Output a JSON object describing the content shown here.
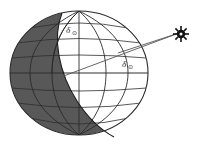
{
  "figure": {
    "name": "earth-solar-declination-diagram",
    "background_color": "#ffffff"
  },
  "globe": {
    "name": "earth-globe",
    "center_x": 79,
    "center_y": 73,
    "radius_x": 69,
    "radius_y": 62,
    "outline_color": "#2a2a2a",
    "night_fill": "#585858",
    "day_fill": "#ffffff",
    "graticule_color": "#3a3a3a",
    "meridian_count": 6,
    "parallel_count": 7
  },
  "terminator": {
    "name": "day-night-terminator",
    "label": "terminator"
  },
  "sun": {
    "name": "sun-symbol",
    "glyph": "sun",
    "x": 181,
    "y": 34,
    "ray_count": 8,
    "color": "#111111"
  },
  "rays": {
    "name": "solar-ray-lines",
    "color": "#555555",
    "count": 2
  },
  "annotations": [
    {
      "name": "declination-angle-upper",
      "symbol": "δ",
      "subscript": "⊙",
      "x": 68,
      "y": 31
    },
    {
      "name": "declination-angle-lower",
      "symbol": "δ",
      "subscript": "⊙",
      "x": 124,
      "y": 65
    }
  ],
  "colors": {
    "night": "#585858",
    "day": "#ffffff",
    "outline": "#2a2a2a",
    "ray": "#555555",
    "text": "#1a1a1a"
  }
}
